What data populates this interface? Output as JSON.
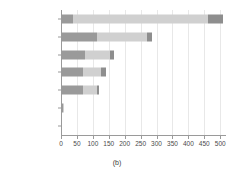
{
  "chart_data": {
    "type": "bar",
    "orientation": "horizontal",
    "stacked": true,
    "title": "",
    "subtitle": "",
    "caption": "(b)",
    "xlabel": "",
    "ylabel": "",
    "xlim": [
      0,
      515
    ],
    "xticks": [
      0,
      50,
      100,
      150,
      200,
      250,
      300,
      350,
      400,
      450,
      500
    ],
    "xtick_labels": [
      "0",
      "50",
      "100",
      "150",
      "200",
      "250",
      "300",
      "350",
      "400",
      "450",
      "500"
    ],
    "grid": true,
    "grid_axis": "x",
    "legend": "none",
    "categories": [
      "fact",
      "shortcoming",
      "suggestion",
      "agreement",
      "question",
      "other",
      "disagreement"
    ],
    "totals": [
      510,
      285,
      168,
      140,
      120,
      10,
      3
    ],
    "series": [
      {
        "name": "segment-1",
        "color": "#9a9a9a",
        "values": [
          38,
          112,
          75,
          68,
          70,
          6,
          3
        ]
      },
      {
        "name": "segment-2",
        "color": "#d0d0d0",
        "values": [
          425,
          158,
          78,
          58,
          44,
          4,
          0
        ]
      },
      {
        "name": "segment-3",
        "color": "#8e8e8e",
        "values": [
          47,
          15,
          15,
          14,
          6,
          0,
          0
        ]
      }
    ],
    "bar_colors": {
      "dark": "#9a9a9a",
      "light": "#d0d0d0",
      "accent": "#8e8e8e"
    },
    "axis_color": "#9a9a9a",
    "grid_color": "#e8e8e8",
    "background": "#ffffff"
  }
}
